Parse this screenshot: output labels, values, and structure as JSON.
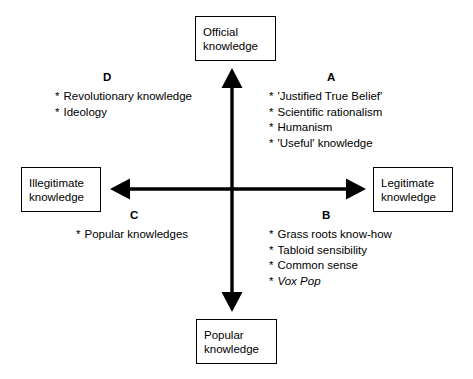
{
  "diagram": {
    "axis_boxes": {
      "top": {
        "line1": "Official",
        "line2": "knowledge"
      },
      "bottom": {
        "line1": "Popular",
        "line2": "knowledge"
      },
      "left": {
        "line1": "Illegitimate",
        "line2": "knowledge"
      },
      "right": {
        "line1": "Legitimate",
        "line2": "knowledge"
      }
    },
    "axes": {
      "vertical_label": "official-popular-axis",
      "horizontal_label": "illegitimate-legitimate-axis",
      "line_color": "#000000",
      "arrowheads": [
        "up",
        "down",
        "left",
        "right"
      ]
    },
    "quadrants": [
      {
        "letter": "A",
        "position": "top-right",
        "bullet": "*",
        "items": [
          {
            "text": "'Justified True Belief'",
            "italic": false
          },
          {
            "text": "Scientific rationalism",
            "italic": false
          },
          {
            "text": "Humanism",
            "italic": false
          },
          {
            "text": "'Useful' knowledge",
            "italic": false
          }
        ]
      },
      {
        "letter": "B",
        "position": "bottom-right",
        "bullet": "*",
        "items": [
          {
            "text": "Grass roots know-how",
            "italic": false
          },
          {
            "text": "Tabloid sensibility",
            "italic": false
          },
          {
            "text": "Common sense",
            "italic": false
          },
          {
            "text": "Vox Pop",
            "italic": true
          }
        ]
      },
      {
        "letter": "C",
        "position": "bottom-left",
        "bullet": "*",
        "items": [
          {
            "text": "Popular knowledges",
            "italic": false
          }
        ]
      },
      {
        "letter": "D",
        "position": "top-left",
        "bullet": "*",
        "items": [
          {
            "text": "Revolutionary knowledge",
            "italic": false
          },
          {
            "text": "Ideology",
            "italic": false
          }
        ]
      }
    ],
    "colors": {
      "background": "#ffffff",
      "ink": "#000000",
      "box_border": "#000000"
    }
  }
}
